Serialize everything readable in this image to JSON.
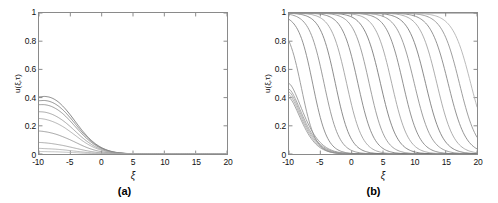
{
  "figure": {
    "panels": [
      {
        "id": "a",
        "caption": "(a)",
        "xlabel": "ξ",
        "ylabel": "u(ξ,τ)",
        "xticks": [
          "-10",
          "-5",
          "0",
          "5",
          "10",
          "15",
          "20"
        ],
        "yticks": [
          "0",
          "0.2",
          "0.4",
          "0.6",
          "0.8",
          "1"
        ]
      },
      {
        "id": "b",
        "caption": "(b)",
        "xlabel": "ξ",
        "ylabel": "u(ξ,τ)",
        "xticks": [
          "-10",
          "-5",
          "0",
          "5",
          "10",
          "15",
          "20"
        ],
        "yticks": [
          "0",
          "0.2",
          "0.4",
          "0.6",
          "0.8",
          "1"
        ]
      }
    ]
  },
  "chart_data": [
    {
      "type": "line",
      "title": "(a)",
      "xlabel": "ξ",
      "ylabel": "u(ξ,τ)",
      "xlim": [
        -10,
        20
      ],
      "ylim": [
        0,
        1
      ],
      "xticks": [
        -10,
        -5,
        0,
        5,
        10,
        15,
        20
      ],
      "yticks": [
        0,
        0.2,
        0.4,
        0.6,
        0.8,
        1
      ],
      "grid": false,
      "legend": "none",
      "description": "Family of decaying pulse profiles; all curves peak near ξ = -10 and decay monotonically to 0 by about ξ = 5.",
      "x": [
        -10,
        -9,
        -8,
        -7,
        -6,
        -5,
        -4,
        -3,
        -2,
        -1,
        0,
        1,
        2,
        3,
        4,
        5,
        7.5,
        10,
        12.5,
        15,
        17.5,
        20
      ],
      "series": [
        {
          "name": "curve-1",
          "color": "#6e6e6e",
          "values": [
            0.405,
            0.408,
            0.398,
            0.372,
            0.33,
            0.277,
            0.218,
            0.161,
            0.112,
            0.073,
            0.045,
            0.026,
            0.014,
            0.008,
            0.004,
            0.002,
            0.0,
            0.0,
            0.0,
            0.0,
            0.0,
            0.0
          ]
        },
        {
          "name": "curve-2",
          "color": "#7a7a7a",
          "values": [
            0.378,
            0.379,
            0.368,
            0.343,
            0.305,
            0.256,
            0.202,
            0.149,
            0.104,
            0.068,
            0.042,
            0.024,
            0.013,
            0.007,
            0.003,
            0.002,
            0.0,
            0.0,
            0.0,
            0.0,
            0.0,
            0.0
          ]
        },
        {
          "name": "curve-3",
          "color": "#868686",
          "values": [
            0.35,
            0.349,
            0.337,
            0.313,
            0.278,
            0.233,
            0.184,
            0.136,
            0.095,
            0.062,
            0.038,
            0.022,
            0.012,
            0.006,
            0.003,
            0.001,
            0.0,
            0.0,
            0.0,
            0.0,
            0.0,
            0.0
          ]
        },
        {
          "name": "curve-4",
          "color": "#949494",
          "values": [
            0.3,
            0.296,
            0.283,
            0.261,
            0.231,
            0.194,
            0.153,
            0.113,
            0.079,
            0.051,
            0.032,
            0.018,
            0.01,
            0.005,
            0.003,
            0.001,
            0.0,
            0.0,
            0.0,
            0.0,
            0.0,
            0.0
          ]
        },
        {
          "name": "curve-5",
          "color": "#a2a2a2",
          "values": [
            0.252,
            0.246,
            0.233,
            0.214,
            0.189,
            0.158,
            0.125,
            0.092,
            0.064,
            0.042,
            0.026,
            0.015,
            0.008,
            0.004,
            0.002,
            0.001,
            0.0,
            0.0,
            0.0,
            0.0,
            0.0,
            0.0
          ]
        },
        {
          "name": "curve-6",
          "color": "#8f8f8f",
          "values": [
            0.163,
            0.158,
            0.149,
            0.136,
            0.119,
            0.1,
            0.079,
            0.058,
            0.04,
            0.026,
            0.016,
            0.009,
            0.005,
            0.003,
            0.001,
            0.001,
            0.0,
            0.0,
            0.0,
            0.0,
            0.0,
            0.0
          ]
        },
        {
          "name": "curve-7",
          "color": "#9b9b9b",
          "values": [
            0.082,
            0.079,
            0.074,
            0.067,
            0.059,
            0.049,
            0.039,
            0.029,
            0.02,
            0.013,
            0.008,
            0.005,
            0.002,
            0.001,
            0.001,
            0.0,
            0.0,
            0.0,
            0.0,
            0.0,
            0.0,
            0.0
          ]
        },
        {
          "name": "curve-8",
          "color": "#a8a8a8",
          "values": [
            0.04,
            0.038,
            0.036,
            0.033,
            0.029,
            0.024,
            0.019,
            0.014,
            0.01,
            0.006,
            0.004,
            0.002,
            0.001,
            0.001,
            0.0,
            0.0,
            0.0,
            0.0,
            0.0,
            0.0,
            0.0,
            0.0
          ]
        },
        {
          "name": "curve-9",
          "color": "#b4b4b4",
          "values": [
            0.018,
            0.017,
            0.016,
            0.015,
            0.013,
            0.011,
            0.009,
            0.006,
            0.004,
            0.003,
            0.002,
            0.001,
            0.0,
            0.0,
            0.0,
            0.0,
            0.0,
            0.0,
            0.0,
            0.0,
            0.0,
            0.0
          ]
        }
      ]
    },
    {
      "type": "line",
      "title": "(b)",
      "xlabel": "ξ",
      "ylabel": "u(ξ,τ)",
      "xlim": [
        -10,
        20
      ],
      "ylim": [
        0,
        1
      ],
      "xticks": [
        -10,
        -5,
        0,
        5,
        10,
        15,
        20
      ],
      "yticks": [
        0,
        0.2,
        0.4,
        0.6,
        0.8,
        1
      ],
      "grid": false,
      "legend": "none",
      "description": "Family of travelling front (kink) profiles descending from u=1 to u=0; successive fronts are shifted progressively to the right, plus a low cluster of small-amplitude decaying curves near ξ = -10.",
      "fronts": [
        {
          "name": "front-1",
          "color": "#8d8d8d",
          "plateau": 0.93,
          "center": -8.0,
          "width": 2.2
        },
        {
          "name": "front-2",
          "color": "#7e7e7e",
          "plateau": 0.99,
          "center": -6.2,
          "width": 2.3
        },
        {
          "name": "front-3",
          "color": "#8a8a8a",
          "plateau": 1.0,
          "center": -4.4,
          "width": 2.4
        },
        {
          "name": "front-4",
          "color": "#767676",
          "plateau": 1.0,
          "center": -2.6,
          "width": 2.4
        },
        {
          "name": "front-5",
          "color": "#9a9a9a",
          "plateau": 1.0,
          "center": -0.8,
          "width": 2.5
        },
        {
          "name": "front-6",
          "color": "#7a7a7a",
          "plateau": 1.0,
          "center": 1.0,
          "width": 2.5
        },
        {
          "name": "front-7",
          "color": "#8e8e8e",
          "plateau": 1.0,
          "center": 2.8,
          "width": 2.5
        },
        {
          "name": "front-8",
          "color": "#727272",
          "plateau": 1.0,
          "center": 4.6,
          "width": 2.6
        },
        {
          "name": "front-9",
          "color": "#9c9c9c",
          "plateau": 1.0,
          "center": 6.4,
          "width": 2.6
        },
        {
          "name": "front-10",
          "color": "#7c7c7c",
          "plateau": 1.0,
          "center": 8.2,
          "width": 2.6
        },
        {
          "name": "front-11",
          "color": "#8b8b8b",
          "plateau": 1.0,
          "center": 10.0,
          "width": 2.7
        },
        {
          "name": "front-12",
          "color": "#747474",
          "plateau": 1.0,
          "center": 11.8,
          "width": 2.7
        },
        {
          "name": "front-13",
          "color": "#9e9e9e",
          "plateau": 1.0,
          "center": 13.6,
          "width": 2.7
        },
        {
          "name": "front-14",
          "color": "#7f7f7f",
          "plateau": 1.0,
          "center": 15.4,
          "width": 2.8
        },
        {
          "name": "front-15",
          "color": "#8c8c8c",
          "plateau": 1.0,
          "center": 17.2,
          "width": 2.8
        },
        {
          "name": "front-16",
          "color": "#aeaeae",
          "plateau": 1.0,
          "center": 19.0,
          "width": 2.9
        }
      ],
      "low_cluster": [
        {
          "name": "low-1",
          "color": "#8a8a8a",
          "start": 0.5,
          "decay": 3.4
        },
        {
          "name": "low-2",
          "color": "#939393",
          "start": 0.46,
          "decay": 3.3
        },
        {
          "name": "low-3",
          "color": "#9c9c9c",
          "start": 0.44,
          "decay": 3.2
        },
        {
          "name": "low-4",
          "color": "#a5a5a5",
          "start": 0.42,
          "decay": 3.1
        },
        {
          "name": "low-5",
          "color": "#8f8f8f",
          "start": 0.4,
          "decay": 3.0
        }
      ],
      "top_line": {
        "name": "saturated-top",
        "color": "#6f6f6f",
        "value": 1.0
      }
    }
  ]
}
